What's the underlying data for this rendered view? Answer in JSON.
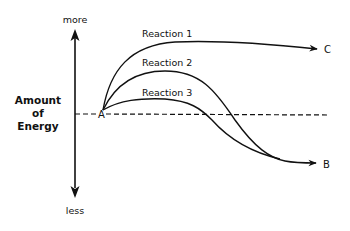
{
  "diagram": {
    "axis": {
      "title_lines": [
        "Amount",
        "of",
        "Energy"
      ],
      "top_label": "more",
      "bottom_label": "less"
    },
    "points": {
      "start": "A",
      "end_high": "C",
      "end_low": "B"
    },
    "reactions": [
      {
        "label": "Reaction 1",
        "ends_at": "C"
      },
      {
        "label": "Reaction 2",
        "ends_at": "B"
      },
      {
        "label": "Reaction 3",
        "ends_at": "B"
      }
    ],
    "colors": {
      "line": "#111111",
      "background": "#ffffff"
    }
  }
}
